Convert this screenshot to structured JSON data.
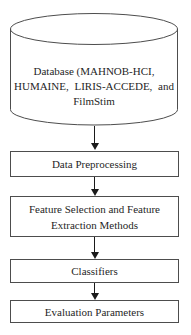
{
  "diagram": {
    "type": "flowchart",
    "database": {
      "shape": "cylinder",
      "full_text": "Database (MAHNOB-HCI, HUMAINE, LIRIS-ACCEDE, and FilmStim",
      "lines": [
        "Database (MAHNOB-HCI,",
        "HUMAINE, LIRIS-ACCEDE, and",
        "FilmStim"
      ]
    },
    "steps": [
      {
        "id": "data-preprocessing",
        "lines": [
          "Data Preprocessing"
        ]
      },
      {
        "id": "feature-selection-extraction",
        "lines": [
          "Feature Selection and Feature",
          "Extraction Methods"
        ]
      },
      {
        "id": "classifiers",
        "lines": [
          "Classifiers"
        ]
      },
      {
        "id": "evaluation-parameters",
        "lines": [
          "Evaluation Parameters"
        ]
      }
    ],
    "colors": {
      "outline": "#4d4d4d",
      "text": "#1f1f1f",
      "arrow": "#1a1a1a",
      "background": "#ffffff"
    }
  }
}
